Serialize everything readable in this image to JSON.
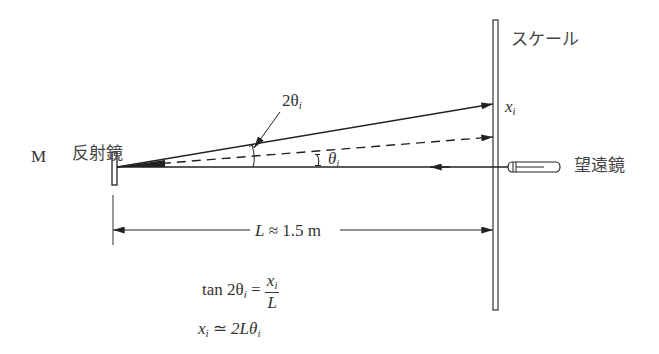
{
  "diagram": {
    "labels": {
      "mirror_letter": "M",
      "mirror_name": "反射鏡",
      "scale": "スケール",
      "telescope": "望遠鏡",
      "x_var": "x",
      "x_sub": "i",
      "angle_double": "2θ",
      "angle_double_sub": "i",
      "angle_single": "θ",
      "angle_single_sub": "i",
      "distance_var": "L",
      "distance_rest": " ≈ 1.5 m"
    },
    "equations": {
      "eq1_lhs": "tan 2θ",
      "eq1_lhs_sub": "i",
      "eq1_eq": " = ",
      "eq1_num": "x",
      "eq1_num_sub": "i",
      "eq1_den": "L",
      "eq2_lhs": "x",
      "eq2_lhs_sub": "i",
      "eq2_eq": " ≃ ",
      "eq2_rhs": "2Lθ",
      "eq2_rhs_sub": "i"
    },
    "colors": {
      "line": "#222222",
      "text": "#333333"
    }
  }
}
